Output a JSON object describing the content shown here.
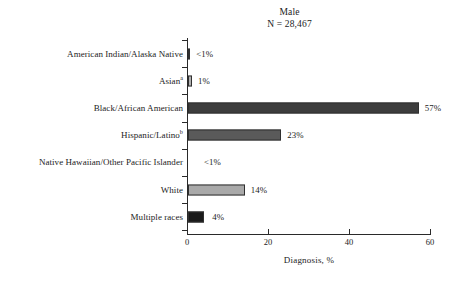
{
  "chart_data": {
    "type": "bar",
    "orientation": "horizontal",
    "title": "Male",
    "subtitle": "N = 28,467",
    "xlabel": "Diagnosis, %",
    "ylabel": "",
    "xlim": [
      0,
      60
    ],
    "xticks": [
      0,
      20,
      40,
      60
    ],
    "xtick_labels": [
      "0",
      "20",
      "40",
      "60"
    ],
    "grid": false,
    "legend": "none",
    "categories": [
      "American Indian/Alaska Native",
      "Asian",
      "Black/African American",
      "Hispanic/Latino",
      "Native Hawaiian/Other Pacific Islander",
      "White",
      "Multiple races"
    ],
    "values": [
      0.4,
      1,
      57,
      23,
      0,
      14,
      4
    ],
    "value_labels": [
      "<1%",
      "1%",
      "57%",
      "23%",
      "<1%",
      "14%",
      "4%"
    ],
    "bar_colors": [
      "#b9b9b9",
      "#b0b0b0",
      "#3d3d3d",
      "#5a5a5a",
      "#ffffff",
      "#a9a9a9",
      "#1a1a1a"
    ],
    "footnote_markers": [
      "",
      "a",
      "",
      "b",
      "",
      "",
      ""
    ]
  },
  "rows": [
    {
      "label": "American Indian/Alaska Native",
      "sup": "",
      "value": 0.4,
      "value_label": "<1%",
      "color": "#b9b9b9",
      "label_offset": 6
    },
    {
      "label": "Asian",
      "sup": "a",
      "value": 1,
      "value_label": "1%",
      "color": "#b0b0b0",
      "label_offset": 6
    },
    {
      "label": "Black/African American",
      "sup": "",
      "value": 57,
      "value_label": "57%",
      "color": "#3d3d3d",
      "label_offset": 6
    },
    {
      "label": "Hispanic/Latino",
      "sup": "b",
      "value": 23,
      "value_label": "23%",
      "color": "#5a5a5a",
      "label_offset": 6
    },
    {
      "label": "Native Hawaiian/Other Pacific Islander",
      "sup": "",
      "value": 0,
      "value_label": "<1%",
      "color": "#ffffff",
      "label_offset": 16
    },
    {
      "label": "White",
      "sup": "",
      "value": 14,
      "value_label": "14%",
      "color": "#a9a9a9",
      "label_offset": 6
    },
    {
      "label": "Multiple races",
      "sup": "",
      "value": 4,
      "value_label": "4%",
      "color": "#1a1a1a",
      "label_offset": 8
    }
  ]
}
